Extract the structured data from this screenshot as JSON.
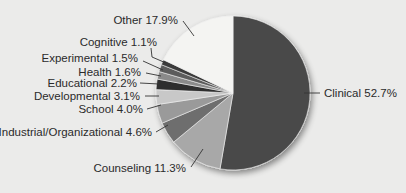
{
  "chart_data": {
    "type": "pie",
    "title": "",
    "start_angle_deg": 0,
    "direction": "clockwise",
    "slices": [
      {
        "label": "Clinical",
        "value": 52.7,
        "display": "Clinical 52.7%",
        "color": "#4a4a4a"
      },
      {
        "label": "Counseling",
        "value": 11.3,
        "display": "Counseling 11.3%",
        "color": "#a8a8a8"
      },
      {
        "label": "Industrial/Organizational",
        "value": 4.6,
        "display": "Industrial/Organizational 4.6%",
        "color": "#6e6e6e"
      },
      {
        "label": "School",
        "value": 4.0,
        "display": "School 4.0%",
        "color": "#9a9a9a"
      },
      {
        "label": "Developmental",
        "value": 3.1,
        "display": "Developmental 3.1%",
        "color": "#c8c8c8"
      },
      {
        "label": "Educational",
        "value": 2.2,
        "display": "Educational 2.2%",
        "color": "#2e2e2e"
      },
      {
        "label": "Health",
        "value": 1.6,
        "display": "Health 1.6%",
        "color": "#8a8a8a"
      },
      {
        "label": "Experimental",
        "value": 1.5,
        "display": "Experimental 1.5%",
        "color": "#5c5c5c"
      },
      {
        "label": "Cognitive",
        "value": 1.1,
        "display": "Cognitive 1.1%",
        "color": "#3a3a3a"
      },
      {
        "label": "Other",
        "value": 17.9,
        "display": "Other 17.9%",
        "color": "#f4f4f2"
      }
    ],
    "legend": "none",
    "labels": "outside with leader lines"
  },
  "labels": {
    "clinical": "Clinical 52.7%",
    "counseling": "Counseling 11.3%",
    "industrial": "Industrial/Organizational 4.6%",
    "school": "School 4.0%",
    "developmental": "Developmental 3.1%",
    "educational": "Educational 2.2%",
    "health": "Health 1.6%",
    "experimental": "Experimental 1.5%",
    "cognitive": "Cognitive 1.1%",
    "other": "Other 17.9%"
  }
}
